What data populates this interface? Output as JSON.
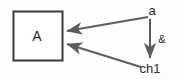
{
  "diagram": {
    "background_color": "#fdfdfd",
    "block": {
      "label": "A",
      "border_color": "#3a3a3a",
      "fill_color": "#ffffff",
      "x": 13,
      "y": 11,
      "width": 49,
      "height": 49,
      "label_x": 37,
      "label_y": 40
    },
    "nodes": [
      {
        "name": "signal-a",
        "label": "a",
        "x": 152,
        "y": 15,
        "anchor": "middle"
      },
      {
        "name": "signal-ch1",
        "label": "ch1",
        "x": 150,
        "y": 72,
        "anchor": "middle"
      }
    ],
    "edge_labels": [
      {
        "name": "ampersand-operator",
        "label": "&",
        "x": 162,
        "y": 43,
        "anchor": "middle"
      }
    ],
    "edges": [
      {
        "name": "edge-a-to-block",
        "from": "a",
        "to": "A",
        "path": "M 148 17 L 67 31",
        "arrow_at": "to",
        "color": "#5d5d5d",
        "width": 2
      },
      {
        "name": "edge-ch1-to-block",
        "from": "ch1",
        "to": "A",
        "path": "M 141 67 L 67 44",
        "arrow_at": "to",
        "color": "#5d5d5d",
        "width": 2
      },
      {
        "name": "edge-a-to-ch1",
        "from": "a",
        "to": "ch1",
        "path": "M 150 19 L 150 58",
        "arrow_at": "to",
        "color": "#5d5d5d",
        "width": 2
      }
    ],
    "colors": {
      "line": "#5d5d5d",
      "block_border": "#3a3a3a",
      "text": "#2b2b2b",
      "background": "#fdfdfd"
    }
  }
}
